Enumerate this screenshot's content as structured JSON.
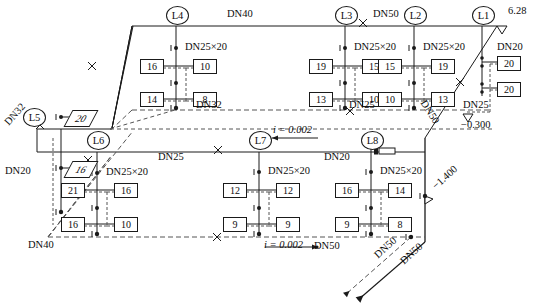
{
  "drawing": {
    "type": "axonometric-piping-diagram",
    "colors": {
      "line": "#1a1a1a",
      "dashed": "#555555",
      "background": "#ffffff"
    }
  },
  "risers": [
    {
      "id": "L1",
      "x": 482,
      "y": 14
    },
    {
      "id": "L2",
      "x": 414,
      "y": 14
    },
    {
      "id": "L3",
      "x": 345,
      "y": 14
    },
    {
      "id": "L4",
      "x": 176,
      "y": 14
    },
    {
      "id": "L5",
      "x": 33,
      "y": 116
    },
    {
      "id": "L6",
      "x": 97,
      "y": 139
    },
    {
      "id": "L7",
      "x": 259,
      "y": 139
    },
    {
      "id": "L8",
      "x": 371,
      "y": 139
    }
  ],
  "branch_labels": [
    {
      "text": "DN25×20",
      "x": 185,
      "y": 36
    },
    {
      "text": "DN25×20",
      "x": 299,
      "y": 36
    },
    {
      "text": "DN25×20",
      "x": 422,
      "y": 36
    },
    {
      "text": "DN25×20",
      "x": 106,
      "y": 163
    },
    {
      "text": "DN25×20",
      "x": 268,
      "y": 161
    },
    {
      "text": "DN25×20",
      "x": 380,
      "y": 161
    }
  ],
  "pipe_labels": [
    {
      "text": "DN40",
      "x": 227,
      "y": 12
    },
    {
      "text": "DN50",
      "x": 375,
      "y": 15
    },
    {
      "text": "DN32",
      "x": 196,
      "y": 102
    },
    {
      "text": "DN25",
      "x": 349,
      "y": 104
    },
    {
      "text": "DN25",
      "x": 467,
      "y": 108
    },
    {
      "text": "DN20",
      "x": 498,
      "y": 54
    },
    {
      "text": "DN25",
      "x": 158,
      "y": 155
    },
    {
      "text": "DN20",
      "x": 332,
      "y": 157
    },
    {
      "text": "DN20",
      "x": 10,
      "y": 171
    },
    {
      "text": "DN40",
      "x": 30,
      "y": 240
    },
    {
      "text": "DN50",
      "x": 316,
      "y": 245
    },
    {
      "text": "DN32",
      "x": 12,
      "y": 126,
      "rotate": -47
    },
    {
      "text": "DN50",
      "x": 430,
      "y": 103,
      "rotate": 57
    },
    {
      "text": "DN50",
      "x": 396,
      "y": 255,
      "rotate": 57
    },
    {
      "text": "DN50",
      "x": 417,
      "y": 258,
      "rotate": 57
    }
  ],
  "elevations": [
    {
      "text": "6.28",
      "x": 507,
      "y": 10
    },
    {
      "text": "−0.300",
      "x": 464,
      "y": 121
    },
    {
      "text": "−1.400",
      "x": 432,
      "y": 200,
      "rotate": 57
    }
  ],
  "slopes": [
    {
      "text": "i = 0.002",
      "x": 277,
      "y": 128
    },
    {
      "text": "i = 0.002",
      "x": 281,
      "y": 245
    }
  ],
  "fixture_boxes": [
    {
      "riser": "L4",
      "row": "top",
      "left": "16",
      "right": "10"
    },
    {
      "riser": "L4",
      "row": "bottom",
      "left": "14",
      "right": "8"
    },
    {
      "riser": "L3",
      "row": "top",
      "left": "19",
      "right": "15"
    },
    {
      "riser": "L3",
      "row": "bottom",
      "left": "13",
      "right": "10"
    },
    {
      "riser": "L2",
      "row": "top",
      "left": "15",
      "right": "19"
    },
    {
      "riser": "L2",
      "row": "bottom",
      "left": "10",
      "right": "13"
    },
    {
      "riser": "L6",
      "row": "top",
      "left": "21",
      "right": "16"
    },
    {
      "riser": "L6",
      "row": "bottom",
      "left": "16",
      "right": "10"
    },
    {
      "riser": "L7",
      "row": "top",
      "left": "12",
      "right": "12"
    },
    {
      "riser": "L7",
      "row": "bottom",
      "left": "9",
      "right": "9"
    },
    {
      "riser": "L8",
      "row": "top",
      "left": "16",
      "right": "14"
    },
    {
      "riser": "L8",
      "row": "bottom",
      "left": "9",
      "right": "8"
    },
    {
      "riser": "L1",
      "row": "top",
      "left": "",
      "right": "20"
    },
    {
      "riser": "L1",
      "row": "bottom",
      "left": "",
      "right": "20"
    },
    {
      "riser": "L5",
      "row": "top",
      "left": "",
      "right": "20"
    },
    {
      "riser": "L5",
      "row": "bottom",
      "left": "",
      "right": "16"
    }
  ],
  "box_values": {
    "l4_top_left": "16",
    "l4_top_right": "10",
    "l4_bot_left": "14",
    "l4_bot_right": "8",
    "l3_top_left": "19",
    "l3_top_right": "15",
    "l3_bot_left": "13",
    "l3_bot_right": "10",
    "l2_top_left": "15",
    "l2_top_right": "19",
    "l2_bot_left": "10",
    "l2_bot_right": "13",
    "l6_top_left": "21",
    "l6_top_right": "16",
    "l6_bot_left": "16",
    "l6_bot_right": "10",
    "l7_top_left": "12",
    "l7_top_right": "12",
    "l7_bot_left": "9",
    "l7_bot_right": "9",
    "l8_top_left": "16",
    "l8_top_right": "14",
    "l8_bot_left": "9",
    "l8_bot_right": "8",
    "l1_top": "20",
    "l1_bot": "20",
    "l5_top": "20",
    "l5_bot": "16"
  }
}
